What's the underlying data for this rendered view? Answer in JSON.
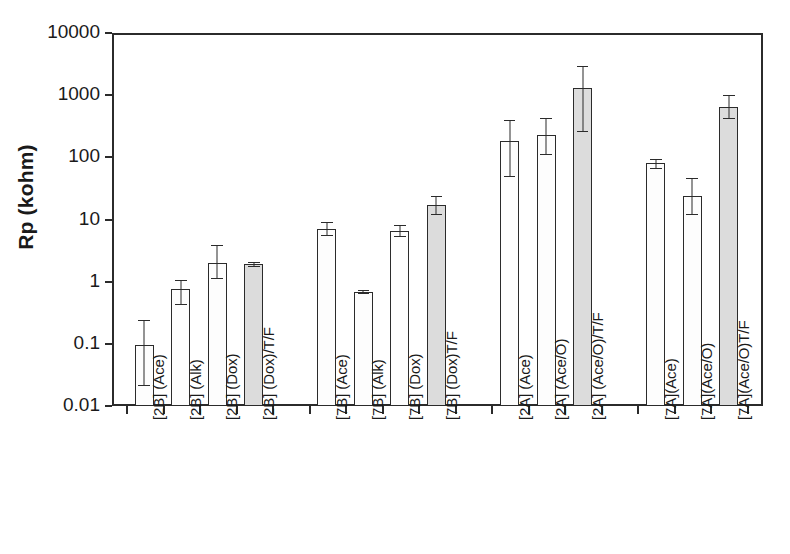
{
  "chart_data": {
    "type": "bar",
    "title": "",
    "xlabel": "",
    "ylabel": "Rp (kohm)",
    "yscale": "log",
    "ylim": [
      0.01,
      10000
    ],
    "ytick_labels": [
      "10000",
      "1000",
      "100",
      "10",
      "1",
      "0.1",
      "0.01"
    ],
    "ytick_values": [
      10000,
      1000,
      100,
      10,
      1,
      0.1,
      0.01
    ],
    "grid": false,
    "legend": null,
    "error_bars": true,
    "categories": [
      "[2B] (Ace)",
      "[2B] (Alk)",
      "[2B] (Dox)",
      "[2B] (Dox)/T/F",
      "[7B] (Ace)",
      "[7B] (Alk)",
      "[7B] (Dox)",
      "[7B] (Dox)T/F",
      "[2A] (Ace)",
      "[2A] (Ace/O)",
      "[2A] (Ace/O)/T/F",
      "[7A](Ace)",
      "[7A](Ace/O)",
      "[7A](Ace/O)T/F"
    ],
    "values": [
      0.095,
      0.75,
      2.0,
      1.9,
      7.0,
      0.68,
      6.5,
      17,
      180,
      230,
      1300,
      80,
      24,
      650
    ],
    "err_low": [
      0.021,
      0.42,
      1.1,
      1.75,
      5.5,
      0.63,
      5.3,
      12,
      48,
      110,
      260,
      66,
      12,
      420
    ],
    "err_high": [
      0.24,
      1.05,
      3.9,
      2.05,
      9.0,
      0.74,
      8.2,
      24,
      400,
      430,
      3000,
      95,
      46,
      1000
    ],
    "bar_styles": [
      "open",
      "open",
      "open",
      "filled",
      "open",
      "open",
      "open",
      "filled",
      "open",
      "open",
      "filled",
      "open",
      "open",
      "filled"
    ],
    "group_breaks": [
      4,
      8,
      11
    ],
    "colors": {
      "open_fill": "#fdfdfd",
      "filled_fill": "#dcdcdc",
      "line": "#2b2b2b",
      "background": "#ffffff"
    }
  }
}
